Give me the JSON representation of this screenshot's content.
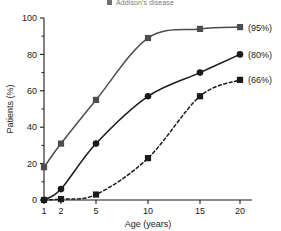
{
  "legend": {
    "marker": "square-marker-icon",
    "label": "Addison's disease"
  },
  "chart_data": {
    "type": "line",
    "title": "",
    "xlabel": "Age (years)",
    "ylabel": "Patients (%)",
    "x": [
      1,
      2,
      5,
      10,
      15,
      20
    ],
    "xtick_labels": [
      "1",
      "2",
      "5",
      "10",
      "15",
      "20"
    ],
    "ytick_labels": [
      "0",
      "20",
      "40",
      "60",
      "80",
      "100"
    ],
    "yticks": [
      0,
      20,
      40,
      60,
      80,
      100
    ],
    "ylim": [
      0,
      100
    ],
    "x_scale": "ordinal",
    "grid": false,
    "legend_position": "top-center",
    "series": [
      {
        "name": "Addison's disease",
        "marker": "square",
        "line_style": "solid",
        "color": "#4d4d4d",
        "values": [
          18,
          31,
          55,
          89,
          94,
          95
        ],
        "end_annotation": "(95%)"
      },
      {
        "name": "series-2",
        "marker": "circle",
        "line_style": "solid",
        "color": "#1a1a1a",
        "values": [
          0,
          6,
          31,
          57,
          70,
          80
        ],
        "end_annotation": "(80%)"
      },
      {
        "name": "series-3",
        "marker": "square",
        "line_style": "dashed",
        "color": "#1a1a1a",
        "values": [
          0,
          0.5,
          3,
          23,
          57,
          66
        ],
        "end_annotation": "(66%)"
      }
    ]
  }
}
